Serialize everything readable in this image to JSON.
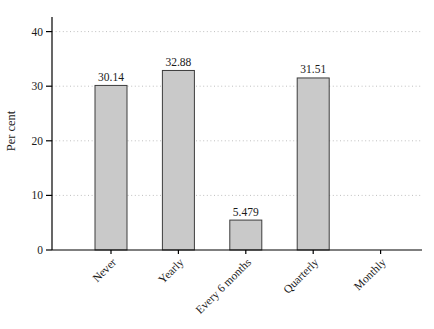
{
  "chart_data": {
    "type": "bar",
    "title": "",
    "xlabel": "",
    "ylabel": "Per cent",
    "categories": [
      "Never",
      "Yearly",
      "Every 6 months",
      "Quarterly",
      "Monthly"
    ],
    "values": [
      30.14,
      32.88,
      5.479,
      31.51,
      0
    ],
    "value_labels": [
      "30.14",
      "32.88",
      "5.479",
      "31.51",
      ""
    ],
    "yticks": [
      0,
      10,
      20,
      30,
      40
    ],
    "ylim": [
      0,
      40
    ],
    "grid": "horizontal-dotted",
    "legend": "none",
    "x_tick_label_rotation_deg": -45,
    "colors": {
      "background": "#ffffff",
      "bar_fill": "#c9c9c9",
      "bar_outline": "#3d3d3d",
      "gridline": "#bfbfbf",
      "axis": "#000000",
      "text": "#1a1a1a"
    }
  }
}
